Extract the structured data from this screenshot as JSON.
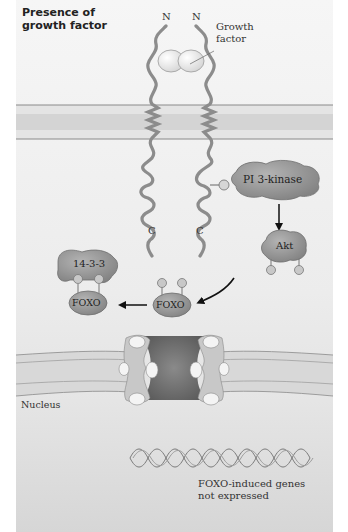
{
  "title": "Presence of growth factor",
  "receptor": {
    "n_terminus_left": "N",
    "n_terminus_right": "N",
    "c_terminus_left": "C",
    "c_terminus_right": "C",
    "ligand_label": "Growth factor"
  },
  "proteins": {
    "pi3k": "PI 3-kinase",
    "akt": "Akt",
    "foxo_free": "FOXO",
    "foxo_bound": "FOXO",
    "chaperone": "14-3-3",
    "phosphate": "P"
  },
  "compartments": {
    "nucleus": "Nucleus"
  },
  "genes_label": "FOXO-induced genes not expressed",
  "colors": {
    "background": "#efefef",
    "membrane_band": "#d2d2d2",
    "membrane_line": "#8a8a8a",
    "protein_fill": "#9b9b9b",
    "protein_dark": "#7a7a7a",
    "receptor_stroke": "#8c8c8c",
    "pore": "#5f5f5f",
    "nucleus_bg": "#dcdcdc",
    "arrow": "#111111"
  }
}
